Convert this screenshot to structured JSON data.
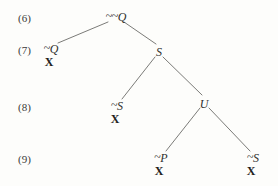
{
  "diagram": {
    "kind": "semantic-tableau",
    "background_color": "#fdfdfb",
    "text_color": "#2e2e2c",
    "edge_color": "#7b7b78",
    "closure_marker": "X",
    "negation_symbol": "~",
    "row_labels": [
      {
        "id": "row-6",
        "text": "(6)",
        "x": 18,
        "y": 12
      },
      {
        "id": "row-7",
        "text": "(7)",
        "x": 18,
        "y": 44
      },
      {
        "id": "row-8",
        "text": "(8)",
        "x": 18,
        "y": 101
      },
      {
        "id": "row-9",
        "text": "(9)",
        "x": 18,
        "y": 153
      }
    ],
    "nodes": [
      {
        "id": "node-double-neg-q",
        "name": "node-double-negation-q",
        "negation": "~~",
        "letter": "Q",
        "label": "~~Q",
        "closed": false,
        "closure": "",
        "x": 116,
        "y": 11,
        "row": "(6)"
      },
      {
        "id": "node-neg-q",
        "name": "node-negation-q",
        "negation": "~",
        "letter": "Q",
        "label": "~Q",
        "closed": true,
        "closure": "X",
        "x": 51,
        "y": 43,
        "row": "(7)"
      },
      {
        "id": "node-s",
        "name": "node-s",
        "negation": "",
        "letter": "S",
        "label": "S",
        "closed": false,
        "closure": "",
        "x": 159,
        "y": 46,
        "row": "(7)"
      },
      {
        "id": "node-neg-s-left",
        "name": "node-negation-s-left",
        "negation": "~",
        "letter": "S",
        "label": "~S",
        "closed": true,
        "closure": "X",
        "x": 117,
        "y": 100,
        "row": "(8)"
      },
      {
        "id": "node-u",
        "name": "node-u",
        "negation": "",
        "letter": "U",
        "label": "U",
        "closed": false,
        "closure": "",
        "x": 204,
        "y": 98,
        "row": "(8)"
      },
      {
        "id": "node-neg-p",
        "name": "node-negation-p",
        "negation": "~",
        "letter": "P",
        "label": "~P",
        "closed": true,
        "closure": "X",
        "x": 161,
        "y": 152,
        "row": "(9)"
      },
      {
        "id": "node-neg-s-right",
        "name": "node-negation-s-right",
        "negation": "~",
        "letter": "S",
        "label": "~S",
        "closed": true,
        "closure": "X",
        "x": 253,
        "y": 152,
        "row": "(9)"
      }
    ],
    "edges": [
      {
        "id": "edge-qq-to-negq",
        "from": "node-double-neg-q",
        "to": "node-neg-q",
        "x1": 108,
        "y1": 22,
        "x2": 58,
        "y2": 43
      },
      {
        "id": "edge-qq-to-s",
        "from": "node-double-neg-q",
        "to": "node-s",
        "x1": 124,
        "y1": 22,
        "x2": 156,
        "y2": 44
      },
      {
        "id": "edge-s-to-negs",
        "from": "node-s",
        "to": "node-neg-s-left",
        "x1": 155,
        "y1": 57,
        "x2": 122,
        "y2": 99
      },
      {
        "id": "edge-s-to-u",
        "from": "node-s",
        "to": "node-u",
        "x1": 163,
        "y1": 57,
        "x2": 202,
        "y2": 95
      },
      {
        "id": "edge-u-to-negp",
        "from": "node-u",
        "to": "node-neg-p",
        "x1": 200,
        "y1": 108,
        "x2": 166,
        "y2": 151
      },
      {
        "id": "edge-u-to-negs",
        "from": "node-u",
        "to": "node-neg-s-right",
        "x1": 209,
        "y1": 108,
        "x2": 250,
        "y2": 151
      }
    ]
  }
}
